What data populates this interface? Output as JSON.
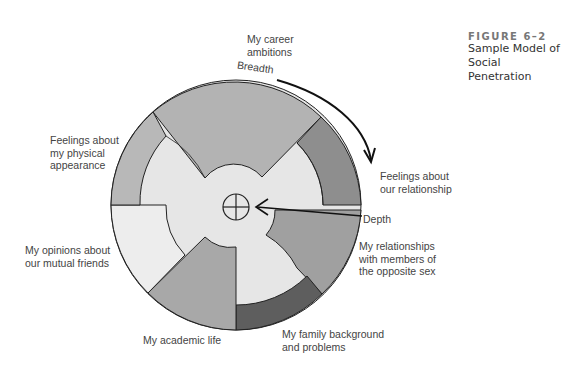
{
  "figure": {
    "number": "FIGURE 6–2",
    "caption_line1": "Sample Model of Social",
    "caption_line2": "Penetration"
  },
  "diagram": {
    "axis_labels": {
      "breadth": "Breadth",
      "depth": "Depth"
    },
    "segments": [
      {
        "id": "career",
        "line1": "My career",
        "line2": "ambitions",
        "line3": ""
      },
      {
        "id": "relationship",
        "line1": "Feelings about",
        "line2": "our relationship",
        "line3": ""
      },
      {
        "id": "opposite-sex",
        "line1": "My relationships",
        "line2": "with members of",
        "line3": "the opposite sex"
      },
      {
        "id": "family",
        "line1": "My family background",
        "line2": "and problems",
        "line3": ""
      },
      {
        "id": "academic",
        "line1": "My academic life",
        "line2": "",
        "line3": ""
      },
      {
        "id": "friends",
        "line1": "My opinions about",
        "line2": "our mutual friends",
        "line3": ""
      },
      {
        "id": "appearance",
        "line1": "Feelings about",
        "line2": "my physical",
        "line3": "appearance"
      }
    ],
    "colors": {
      "light": "#e8e8e8",
      "medium": "#b0b0b0",
      "dark": "#8a8a8a",
      "darkest": "#5a5a5a",
      "outline": "#222222"
    }
  }
}
